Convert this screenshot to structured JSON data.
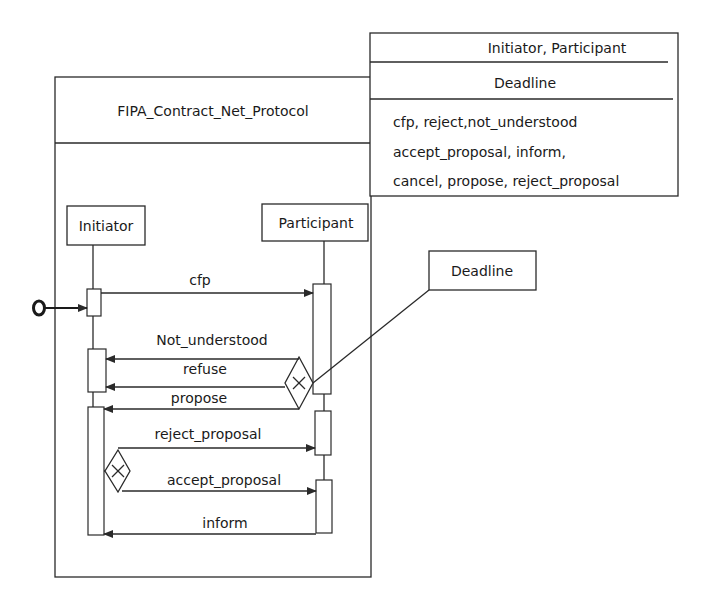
{
  "protocol": {
    "name": "FIPA_Contract_Net_Protocol"
  },
  "parameters": {
    "roles": "Initiator, Participant",
    "deadline": "Deadline",
    "acts": [
      "cfp, reject,not_understood",
      "accept_proposal, inform,",
      "cancel, propose, reject_proposal"
    ]
  },
  "lifelines": {
    "initiator": "Initiator",
    "participant": "Participant"
  },
  "deadline_note": "Deadline",
  "messages": {
    "cfp": "cfp",
    "not_understood": "Not_understood",
    "refuse": "refuse",
    "propose": "propose",
    "reject_proposal": "reject_proposal",
    "accept_proposal": "accept_proposal",
    "inform": "inform"
  },
  "colors": {
    "line": "#2a2a2a",
    "background": "#ffffff"
  }
}
